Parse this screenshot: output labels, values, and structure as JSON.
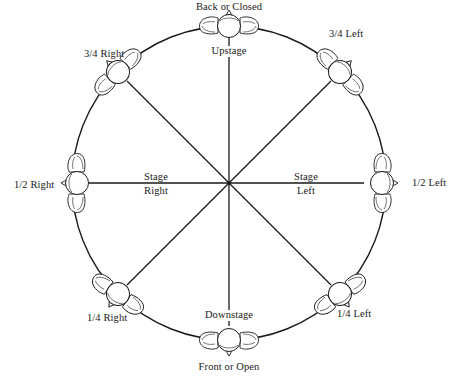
{
  "diagram": {
    "center": {
      "x": 229,
      "y": 183
    },
    "radius": 157,
    "positions": [
      {
        "id": "back",
        "label": "Back or Closed",
        "angle_deg": -90
      },
      {
        "id": "three-quarter-left",
        "label": "3/4 Left",
        "angle_deg": -45
      },
      {
        "id": "half-left",
        "label": "1/2 Left",
        "angle_deg": 0
      },
      {
        "id": "quarter-left",
        "label": "1/4 Left",
        "angle_deg": 45
      },
      {
        "id": "front",
        "label": "Front or Open",
        "angle_deg": 90
      },
      {
        "id": "quarter-right",
        "label": "1/4 Right",
        "angle_deg": 135
      },
      {
        "id": "half-right",
        "label": "1/2 Right",
        "angle_deg": 180
      },
      {
        "id": "three-quarter-right",
        "label": "3/4 Right",
        "angle_deg": 225
      }
    ],
    "stage_areas": {
      "upstage": "Upstage",
      "downstage": "Downstage",
      "stage_right_line1": "Stage",
      "stage_right_line2": "Right",
      "stage_left_line1": "Stage",
      "stage_left_line2": "Left"
    },
    "colors": {
      "stroke": "#1a1a1a",
      "background": "#ffffff"
    }
  }
}
